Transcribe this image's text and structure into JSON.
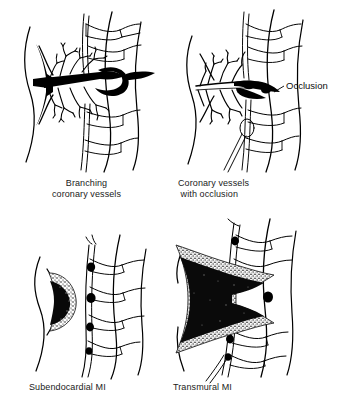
{
  "figure": {
    "background_color": "#ffffff",
    "ink_color": "#000000",
    "panels": [
      {
        "id": "branching",
        "caption_line1": "Branching",
        "caption_line2": "coronary vessels",
        "caption": "Branching coronary vessels",
        "description": "Patent coronary artery with open branches feeding the myocardial wall"
      },
      {
        "id": "occlusion",
        "caption_line1": "Coronary vessels",
        "caption_line2": "with occlusion",
        "caption": "Coronary vessels with occlusion",
        "annotation": "Occlusion",
        "description": "Coronary artery blocked at the branch point; distal vessels collapsed"
      },
      {
        "id": "subendocardial",
        "caption": "Subendocardial MI",
        "description": "Crescent shaped infarct limited to the inner layer of the ventricular wall"
      },
      {
        "id": "transmural",
        "caption": "Transmural MI",
        "description": "Infarct extending through the full thickness of the ventricular wall"
      }
    ]
  },
  "colors": {
    "line": "#000000",
    "necrosis_core": "#0a0a0a",
    "necrosis_rim": "#8c8c8c",
    "background": "#ffffff",
    "caption_text": "#1a1a1a"
  }
}
